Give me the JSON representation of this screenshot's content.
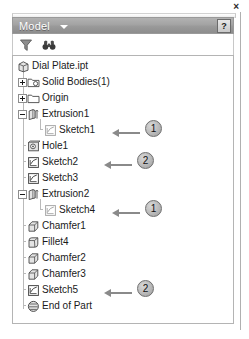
{
  "window": {
    "close_label": "×",
    "close_icon": "close-icon"
  },
  "title_bar": {
    "title": "Model",
    "dropdown_icon": "chevron-down-icon",
    "help_label": "?",
    "help_icon": "help-icon",
    "background_color": "#9a9a9a",
    "text_color": "#ffffff"
  },
  "toolbar": {
    "buttons": [
      {
        "name": "filter-icon",
        "tooltip": "Filter"
      },
      {
        "name": "find-icon",
        "tooltip": "Find"
      }
    ]
  },
  "tree": {
    "root_label": "Dial Plate.ipt",
    "items": [
      {
        "label": "Dial Plate.ipt",
        "icon": "part-document-icon",
        "depth": 0,
        "expander": "none",
        "dimmed": false
      },
      {
        "label": "Solid Bodies(1)",
        "icon": "solid-bodies-folder-icon",
        "depth": 1,
        "expander": "plus",
        "dimmed": false
      },
      {
        "label": "Origin",
        "icon": "folder-icon",
        "depth": 1,
        "expander": "plus",
        "dimmed": false
      },
      {
        "label": "Extrusion1",
        "icon": "extrusion-icon",
        "depth": 1,
        "expander": "minus",
        "dimmed": false
      },
      {
        "label": "Sketch1",
        "icon": "sketch-icon",
        "depth": 2,
        "expander": "none",
        "dimmed": true
      },
      {
        "label": "Hole1",
        "icon": "hole-icon",
        "depth": 1,
        "expander": "none",
        "dimmed": false
      },
      {
        "label": "Sketch2",
        "icon": "sketch-icon",
        "depth": 1,
        "expander": "none",
        "dimmed": false
      },
      {
        "label": "Sketch3",
        "icon": "sketch-icon",
        "depth": 1,
        "expander": "none",
        "dimmed": false
      },
      {
        "label": "Extrusion2",
        "icon": "extrusion-icon",
        "depth": 1,
        "expander": "minus",
        "dimmed": false
      },
      {
        "label": "Sketch4",
        "icon": "sketch-icon",
        "depth": 2,
        "expander": "none",
        "dimmed": true
      },
      {
        "label": "Chamfer1",
        "icon": "chamfer-icon",
        "depth": 1,
        "expander": "none",
        "dimmed": false
      },
      {
        "label": "Fillet4",
        "icon": "fillet-icon",
        "depth": 1,
        "expander": "none",
        "dimmed": false
      },
      {
        "label": "Chamfer2",
        "icon": "chamfer-icon",
        "depth": 1,
        "expander": "none",
        "dimmed": false
      },
      {
        "label": "Chamfer3",
        "icon": "chamfer-icon",
        "depth": 1,
        "expander": "none",
        "dimmed": false
      },
      {
        "label": "Sketch5",
        "icon": "sketch-icon",
        "depth": 1,
        "expander": "none",
        "dimmed": false
      },
      {
        "label": "End of Part",
        "icon": "end-of-part-icon",
        "depth": 1,
        "expander": "none",
        "dimmed": false
      }
    ]
  },
  "annotations": [
    {
      "number": "1",
      "target": "Sketch1"
    },
    {
      "number": "2",
      "target": "Sketch2"
    },
    {
      "number": "1",
      "target": "Sketch4"
    },
    {
      "number": "2",
      "target": "Sketch5"
    }
  ]
}
